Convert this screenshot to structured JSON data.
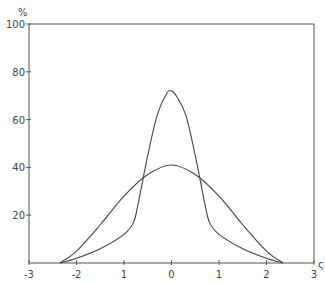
{
  "chart_data": {
    "type": "line",
    "title": "",
    "xlabel": "ς",
    "ylabel": "%",
    "xlim": [
      -3,
      3
    ],
    "ylim": [
      0,
      100
    ],
    "grid": false,
    "legend": null,
    "x_ticks": [
      -3,
      -2,
      -1,
      0,
      1,
      2,
      3
    ],
    "x_tick_labels": [
      "-3",
      "-2",
      "1",
      "0",
      "1",
      "2",
      "3"
    ],
    "y_ticks": [
      20,
      40,
      60,
      80,
      100
    ],
    "y_tick_labels": [
      "20",
      "40",
      "60",
      "80",
      "100"
    ],
    "series": [
      {
        "name": "narrow peaked curve",
        "x": [
          -2.35,
          -2.0,
          -1.5,
          -1.0,
          -0.8,
          -0.7,
          -0.5,
          -0.3,
          -0.1,
          0.0,
          0.1,
          0.3,
          0.5,
          0.7,
          0.8,
          1.0,
          1.5,
          2.0,
          2.35
        ],
        "y": [
          0,
          2,
          6,
          12,
          17,
          25,
          45,
          62,
          71,
          72,
          70,
          62,
          45,
          25,
          17,
          12,
          6,
          2,
          0
        ]
      },
      {
        "name": "broad curve",
        "x": [
          -2.35,
          -2.0,
          -1.5,
          -1.0,
          -0.5,
          0.0,
          0.5,
          1.0,
          1.5,
          2.0,
          2.35
        ],
        "y": [
          0,
          5,
          16,
          28,
          37,
          41,
          37,
          28,
          16,
          5,
          0
        ]
      }
    ]
  }
}
